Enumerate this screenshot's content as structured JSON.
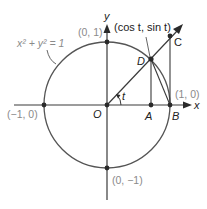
{
  "diagram": {
    "type": "unit-circle",
    "colors": {
      "line": "#3a3a3a",
      "circle": "#555555",
      "point": "#2a2a2a",
      "label_gray": "#8a8a8a",
      "label_dark": "#222222"
    },
    "equation": "x² + y² = 1",
    "axes": {
      "x_label": "x",
      "y_label": "y"
    },
    "points": {
      "top": "(0, 1)",
      "bottom": "(0, −1)",
      "left": "(−1, 0)",
      "right": "(1, 0)",
      "D_coords": "(cos t, sin t)"
    },
    "letters": {
      "origin": "O",
      "A": "A",
      "B": "B",
      "C": "C",
      "D": "D",
      "angle": "t"
    }
  }
}
